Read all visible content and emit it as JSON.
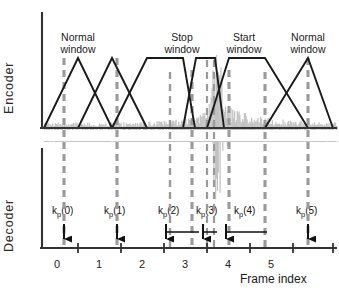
{
  "figure": {
    "panels": {
      "encoder_label": "Encoder",
      "decoder_label": "Decoder"
    },
    "x_axis": {
      "title": "Frame index",
      "tick_labels": [
        "0",
        "1",
        "2",
        "3",
        "4",
        "5"
      ]
    },
    "window_labels": [
      {
        "id": "w0",
        "line1": "Normal",
        "line2": "window"
      },
      {
        "id": "w2",
        "line1": "Stop",
        "line2": "window"
      },
      {
        "id": "w3",
        "line1": "Start",
        "line2": "window"
      },
      {
        "id": "w5",
        "line1": "Normal",
        "line2": "window"
      }
    ],
    "k_markers": [
      {
        "id": "kp0",
        "prefix": "k",
        "sub": "p",
        "suffix": "(0)"
      },
      {
        "id": "kp1",
        "prefix": "k",
        "sub": "p",
        "suffix": "(1)"
      },
      {
        "id": "kp2",
        "prefix": "k",
        "sub": "p",
        "suffix": "(2)"
      },
      {
        "id": "kp3",
        "prefix": "k",
        "sub": "p",
        "suffix": "(3)"
      },
      {
        "id": "kp4",
        "prefix": "k",
        "sub": "p",
        "suffix": "(4)"
      },
      {
        "id": "kp5",
        "prefix": "k",
        "sub": "p",
        "suffix": "(5)"
      }
    ],
    "colors": {
      "axis": "#333333",
      "window_outline": "#1a1a1a",
      "dashed_marker": "#999999",
      "signal_noise": "#bfbfbf",
      "text": "#1a1a1a"
    }
  },
  "chart_data": {
    "type": "line",
    "title": "",
    "xlabel": "Frame index",
    "ylabel": "",
    "xlim": [
      -0.35,
      5.95
    ],
    "ylim": [
      0,
      1
    ],
    "grid": false,
    "legend": "none",
    "x_ticks": [
      0,
      1,
      2,
      3,
      4,
      5
    ],
    "series": [
      {
        "name": "MDCT window sequence (encoder)",
        "type": "line",
        "points": [
          [
            -0.35,
            0.0
          ],
          [
            0.5,
            1.0
          ],
          [
            1.5,
            0.0
          ],
          [
            0.5,
            0.0
          ],
          [
            1.5,
            1.0
          ],
          [
            2.5,
            0.0
          ],
          [
            1.5,
            0.0
          ],
          [
            2.5,
            1.0
          ],
          [
            2.95,
            1.0
          ],
          [
            3.18,
            0.0
          ],
          [
            2.95,
            0.0
          ],
          [
            3.24,
            1.0
          ],
          [
            3.48,
            1.0
          ],
          [
            3.62,
            0.0
          ],
          [
            3.3,
            0.0
          ],
          [
            3.7,
            1.0
          ],
          [
            4.55,
            1.0
          ],
          [
            5.55,
            0.0
          ],
          [
            3.7,
            0.0
          ],
          [
            4.55,
            0.0
          ],
          [
            5.55,
            1.0
          ],
          [
            5.95,
            0.0
          ]
        ],
        "window_types": [
          "normal",
          "normal",
          "stop",
          "short",
          "start",
          "normal"
        ]
      },
      {
        "name": "Audio signal (noise with transient burst)",
        "type": "area",
        "baseline_amplitude": 0.08,
        "transient_center": 3.35,
        "transient_peak": 1.45
      }
    ],
    "annotations": [
      {
        "label": "Normal window",
        "x": 0.5
      },
      {
        "label": "Normal window",
        "x": 1.5
      },
      {
        "label": "Stop window",
        "x": 2.85
      },
      {
        "label": "Start window",
        "x": 4.12
      },
      {
        "label": "Normal window",
        "x": 5.55
      },
      {
        "label": "k_p(0)",
        "x": 0.5
      },
      {
        "label": "k_p(1)",
        "x": 1.5
      },
      {
        "label": "k_p(2)",
        "x": 2.5
      },
      {
        "label": "k_p(3)",
        "x": 3.3
      },
      {
        "label": "k_p(4)",
        "x": 3.7
      },
      {
        "label": "k_p(5)",
        "x": 5.55
      }
    ]
  }
}
